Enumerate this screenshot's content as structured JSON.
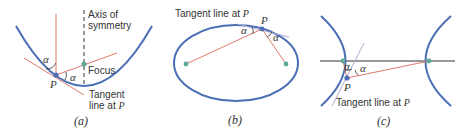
{
  "colors": {
    "curve": "#4a6fb5",
    "ray": "#e07a6a",
    "axis": "#333333",
    "focus": "#5fa89c",
    "point": "#4a6fb5",
    "text": "#333333"
  },
  "panels": [
    {
      "id": "a",
      "caption": "(a)",
      "curve_type": "parabola",
      "labels": {
        "axis": [
          "Axis of",
          "symmetry"
        ],
        "focus": "Focus",
        "point": "P",
        "tangent": [
          "Tangent",
          "line at "
        ],
        "tangent_point": "P",
        "angle1": "α",
        "angle2": "α"
      }
    },
    {
      "id": "b",
      "caption": "(b)",
      "curve_type": "ellipse",
      "labels": {
        "tangent": "Tangent line at ",
        "tangent_point": "P",
        "point": "P",
        "angle1": "α",
        "angle2": "α"
      }
    },
    {
      "id": "c",
      "caption": "(c)",
      "curve_type": "hyperbola",
      "labels": {
        "tangent": "Tangent line at ",
        "tangent_point": "P",
        "point": "P",
        "angle1": "α",
        "angle2": "α"
      }
    }
  ]
}
